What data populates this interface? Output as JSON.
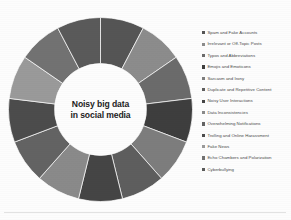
{
  "figure": {
    "center_label_lines": [
      "Noisy big data",
      "in social media"
    ],
    "background_color": "#fdfdfd",
    "rule_color": "#e2e2e2"
  },
  "legend": {
    "position": "right",
    "marker": "square-swatch",
    "items": [
      "Spam and Fake Accounts",
      "Irrelevant or Off-Topic Posts",
      "Typos and Abbreviations",
      "Emojis and Emoticons",
      "Sarcasm and Irony",
      "Duplicate and Repetitive Content",
      "Noisy User Interactions",
      "Data Inconsistencies",
      "Overwhelming Notifications",
      "Trolling and Online Harassment",
      "Fake News",
      "Echo Chambers and Polarization",
      "Cyberbullying"
    ]
  },
  "chart_data": {
    "type": "pie",
    "variant": "doughnut",
    "title": "Noisy big data in social media",
    "xlabel": "",
    "ylabel": "",
    "categories": [
      "Spam and Fake Accounts",
      "Irrelevant or Off-Topic Posts",
      "Typos and Abbreviations",
      "Emojis and Emoticons",
      "Sarcasm and Irony",
      "Duplicate and Repetitive Content",
      "Noisy User Interactions",
      "Data Inconsistencies",
      "Overwhelming Notifications",
      "Trolling and Online Harassment",
      "Fake News",
      "Echo Chambers and Polarization",
      "Cyberbullying"
    ],
    "values": [
      1,
      1,
      1,
      1,
      1,
      1,
      1,
      1,
      1,
      1,
      1,
      1,
      1
    ],
    "percentages": [
      7.7,
      7.7,
      7.7,
      7.7,
      7.7,
      7.7,
      7.7,
      7.7,
      7.7,
      7.7,
      7.7,
      7.7,
      7.7
    ],
    "colors": [
      "#555555",
      "#8c8c8c",
      "#6b6b6b",
      "#3e3e3e",
      "#7d7d7d",
      "#5e5e5e",
      "#454545",
      "#8a8a8a",
      "#636363",
      "#4c4c4c",
      "#9a9a9a",
      "#727272",
      "#5a5a5a"
    ],
    "start_angle": 0,
    "hole_fraction": 0.5,
    "legend_position": "right",
    "grid": false,
    "data_labels": false
  }
}
